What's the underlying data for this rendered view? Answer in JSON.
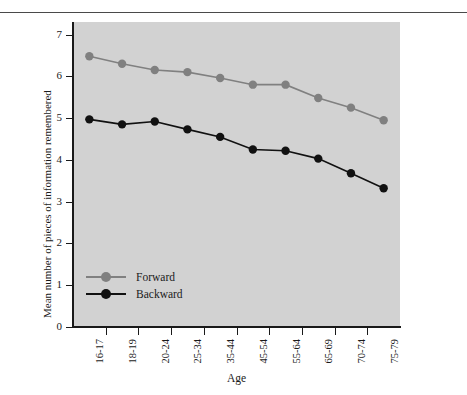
{
  "chart_data": {
    "type": "line",
    "title": "",
    "xlabel": "Age",
    "ylabel": "Mean number of pieces of information remembered",
    "categories": [
      "16-17",
      "18-19",
      "20-24",
      "25-34",
      "35-44",
      "45-54",
      "55-64",
      "65-69",
      "70-74",
      "75-79"
    ],
    "ylim": [
      0,
      7.3
    ],
    "yticks": [
      0,
      1,
      2,
      3,
      4,
      5,
      6,
      7
    ],
    "ytick_labels": [
      "0",
      "1",
      "2",
      "3",
      "4",
      "5",
      "6",
      "7"
    ],
    "grid": false,
    "legend_position": "inside-lower-left",
    "series": [
      {
        "name": "Forward",
        "color": "#808080",
        "marker": "circle",
        "values": [
          6.48,
          6.3,
          6.15,
          6.1,
          5.96,
          5.8,
          5.8,
          5.48,
          5.25,
          4.95
        ]
      },
      {
        "name": "Backward",
        "color": "#111111",
        "marker": "circle",
        "values": [
          4.97,
          4.85,
          4.92,
          4.73,
          4.55,
          4.25,
          4.22,
          4.03,
          3.68,
          3.32
        ]
      }
    ]
  },
  "legend": {
    "items": [
      {
        "label": "Forward"
      },
      {
        "label": "Backward"
      }
    ]
  },
  "colors": {
    "plot_background": "#d2d2d2",
    "page_background": "#ffffff",
    "axis": "#1a1a1a",
    "forward_series": "#808080",
    "backward_series": "#111111"
  }
}
